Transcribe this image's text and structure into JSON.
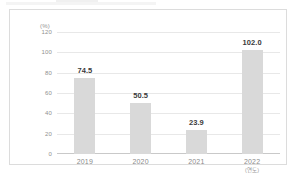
{
  "chart_data": {
    "type": "bar",
    "title": "",
    "xlabel": "",
    "ylabel": "",
    "y_unit_label": "(%)",
    "x_unit_label": "(연도)",
    "categories": [
      "2019",
      "2020",
      "2021",
      "2022"
    ],
    "values": [
      74.5,
      50.5,
      23.9,
      102.0
    ],
    "value_labels": [
      "74.5",
      "50.5",
      "23.9",
      "102.0"
    ],
    "ylim": [
      0,
      120
    ],
    "yticks": [
      120,
      100,
      80,
      60,
      40,
      20,
      0
    ],
    "ytick_labels": [
      "120",
      "100",
      "80",
      "60",
      "40",
      "20",
      "0"
    ],
    "grid": true,
    "legend": false,
    "bar_color": "#d9d9d9",
    "gridline_color": "#e8e8e8",
    "axis_color": "#c9c9c9",
    "label_color": "#8f8f8f",
    "value_color": "#3a3a3a",
    "frame_color": "#dcdcdc"
  }
}
